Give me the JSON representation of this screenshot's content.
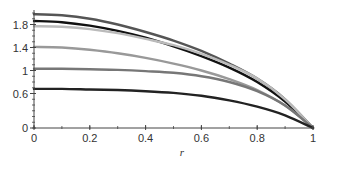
{
  "chart_data": {
    "type": "line",
    "title": "",
    "xlabel": "r",
    "ylabel": "",
    "xlim": [
      0,
      1
    ],
    "ylim": [
      0,
      2
    ],
    "grid": false,
    "legend": null,
    "x_ticks": [
      {
        "value": 0,
        "label": "0"
      },
      {
        "value": 0.2,
        "label": "0.2"
      },
      {
        "value": 0.4,
        "label": "0.4"
      },
      {
        "value": 0.6,
        "label": "0.6"
      },
      {
        "value": 0.8,
        "label": "0.8"
      },
      {
        "value": 1,
        "label": "1"
      }
    ],
    "y_ticks": [
      {
        "value": 0,
        "label": "0"
      },
      {
        "value": 0.6,
        "label": "0.6"
      },
      {
        "value": 1,
        "label": "1"
      },
      {
        "value": 1.4,
        "label": "1.4"
      },
      {
        "value": 1.8,
        "label": "1.8"
      }
    ],
    "x": [
      0,
      0.1,
      0.2,
      0.3,
      0.4,
      0.5,
      0.6,
      0.7,
      0.8,
      0.9,
      1.0
    ],
    "series": [
      {
        "name": "curve-1",
        "color": "#555555",
        "values": [
          1.98,
          1.96,
          1.9,
          1.8,
          1.67,
          1.52,
          1.34,
          1.12,
          0.86,
          0.5,
          0.0
        ]
      },
      {
        "name": "curve-2",
        "color": "#111111",
        "values": [
          1.86,
          1.84,
          1.78,
          1.69,
          1.57,
          1.42,
          1.25,
          1.05,
          0.8,
          0.46,
          0.0
        ]
      },
      {
        "name": "curve-3",
        "color": "#bbbbbb",
        "values": [
          1.77,
          1.76,
          1.72,
          1.65,
          1.55,
          1.44,
          1.29,
          1.1,
          0.86,
          0.5,
          0.0
        ]
      },
      {
        "name": "curve-4",
        "color": "#999999",
        "values": [
          1.41,
          1.4,
          1.36,
          1.3,
          1.22,
          1.12,
          1.0,
          0.85,
          0.66,
          0.39,
          0.0
        ]
      },
      {
        "name": "curve-5",
        "color": "#777777",
        "values": [
          1.03,
          1.03,
          1.02,
          1.01,
          0.99,
          0.96,
          0.9,
          0.8,
          0.64,
          0.39,
          0.0
        ]
      },
      {
        "name": "curve-6",
        "color": "#222222",
        "values": [
          0.68,
          0.68,
          0.67,
          0.66,
          0.64,
          0.61,
          0.56,
          0.48,
          0.37,
          0.22,
          0.0
        ]
      }
    ]
  }
}
